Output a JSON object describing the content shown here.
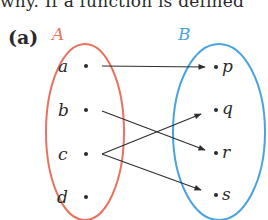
{
  "header": {
    "cut_text": "why. If a function is defined"
  },
  "figure": {
    "part_label": "(a)",
    "set_A": {
      "label": "A",
      "color": "#e8735f",
      "elements": [
        "a",
        "b",
        "c",
        "d"
      ]
    },
    "set_B": {
      "label": "B",
      "color": "#4aa3df",
      "elements": [
        "p",
        "q",
        "r",
        "s"
      ]
    },
    "mappings": [
      {
        "from": "a",
        "to": "p"
      },
      {
        "from": "b",
        "to": "r"
      },
      {
        "from": "c",
        "to": "q"
      },
      {
        "from": "c",
        "to": "s"
      }
    ],
    "arrow_color": "#2e2e2e"
  }
}
